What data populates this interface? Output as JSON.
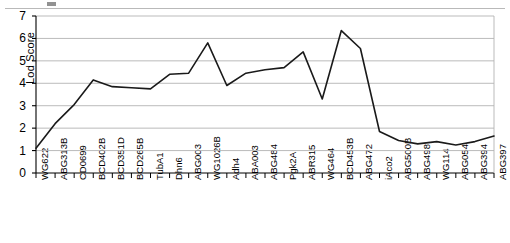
{
  "figure": {
    "top_rule": "horizontal-divider",
    "background_color": "#ffffff",
    "line_color": "#1a1a1a",
    "grid_color": "#b3b3b3",
    "axis_color": "#000000"
  },
  "chart_data": {
    "type": "line",
    "title": "",
    "xlabel": "",
    "ylabel": "Lod Score",
    "ylim": [
      0,
      7
    ],
    "yticks": [
      0,
      1,
      2,
      3,
      4,
      5,
      6,
      7
    ],
    "ytick_labels": [
      "0",
      "1",
      "2",
      "3",
      "4",
      "5",
      "6",
      "7"
    ],
    "grid": true,
    "grid_axis": "y",
    "legend": false,
    "legend_position": "none",
    "marker": "none",
    "categories": [
      "WG622",
      "ABG313B",
      "CD0699",
      "BCD402B",
      "BCD351D",
      "BCD265B",
      "TubA1",
      "Dhn6",
      "ABG003",
      "WG1026B",
      "Adh4",
      "ABA003",
      "ABG484",
      "Pgk2A",
      "ABR315",
      "WG464",
      "BCD453B",
      "ABG472",
      "iAco2",
      "ABG500B",
      "ABG498",
      "WG114",
      "ABG054",
      "ABG394",
      "ABG397"
    ],
    "values": [
      1.1,
      2.2,
      3.05,
      4.15,
      3.85,
      3.8,
      3.75,
      4.4,
      4.45,
      5.8,
      3.9,
      4.45,
      4.6,
      4.7,
      5.4,
      3.3,
      6.35,
      5.55,
      1.85,
      1.45,
      1.3,
      1.4,
      1.25,
      1.4,
      1.65
    ],
    "series": [
      {
        "name": "Lod Score",
        "values": [
          1.1,
          2.2,
          3.05,
          4.15,
          3.85,
          3.8,
          3.75,
          4.4,
          4.45,
          5.8,
          3.9,
          4.45,
          4.6,
          4.7,
          5.4,
          3.3,
          6.35,
          5.55,
          1.85,
          1.45,
          1.3,
          1.4,
          1.25,
          1.4,
          1.65
        ]
      }
    ]
  }
}
